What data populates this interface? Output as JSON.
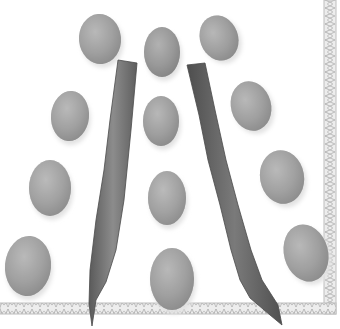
{
  "image": {
    "description": "Grayscale photograph of fourteen beans arranged around two long bean pods, with a decorative braided border along the right and bottom edges",
    "palette": {
      "background": "#ffffff",
      "bean_light": "#b4b4b4",
      "bean_mid": "#9a9a9a",
      "bean_dark": "#7c7c7c",
      "pod_light": "#8a8a8a",
      "pod_dark": "#555555",
      "border": "#c8c8c8",
      "border_line": "#a8a8a8"
    }
  },
  "beans": [
    {
      "cx": 100,
      "cy": 39,
      "rx": 21,
      "ry": 25,
      "rot": -5,
      "tone": "#a2a2a2"
    },
    {
      "cx": 162,
      "cy": 52,
      "rx": 18,
      "ry": 25,
      "rot": 0,
      "tone": "#8e8e8e"
    },
    {
      "cx": 219,
      "cy": 38,
      "rx": 19,
      "ry": 23,
      "rot": -20,
      "tone": "#a0a0a0"
    },
    {
      "cx": 70,
      "cy": 116,
      "rx": 19,
      "ry": 25,
      "rot": 5,
      "tone": "#a6a6a6"
    },
    {
      "cx": 161,
      "cy": 121,
      "rx": 18,
      "ry": 25,
      "rot": 0,
      "tone": "#a0a0a0"
    },
    {
      "cx": 251,
      "cy": 106,
      "rx": 20,
      "ry": 25,
      "rot": -15,
      "tone": "#a4a4a4"
    },
    {
      "cx": 50,
      "cy": 188,
      "rx": 21,
      "ry": 28,
      "rot": 0,
      "tone": "#a8a8a8"
    },
    {
      "cx": 167,
      "cy": 198,
      "rx": 19,
      "ry": 27,
      "rot": 0,
      "tone": "#a8a8a8"
    },
    {
      "cx": 282,
      "cy": 177,
      "rx": 22,
      "ry": 27,
      "rot": -10,
      "tone": "#a6a6a6"
    },
    {
      "cx": 28,
      "cy": 266,
      "rx": 23,
      "ry": 30,
      "rot": 5,
      "tone": "#a6a6a6"
    },
    {
      "cx": 172,
      "cy": 279,
      "rx": 22,
      "ry": 31,
      "rot": 0,
      "tone": "#a2a2a2"
    },
    {
      "cx": 306,
      "cy": 253,
      "rx": 22,
      "ry": 29,
      "rot": -15,
      "tone": "#a4a4a4"
    }
  ],
  "pods": [
    {
      "path": "M118,60 L137,63 L131,130 L124,200 L116,250 L106,282 L96,300 L92,326 L89,304 L90,270 L96,220 L104,170 L110,120 Z",
      "tone": "#7a7a7a"
    },
    {
      "path": "M187,65 L205,63 L215,110 L226,160 L238,205 L251,250 L262,280 L278,305 L282,325 L270,315 L250,298 L240,280 L231,250 L220,205 L208,160 L199,115 Z",
      "tone": "#666666"
    }
  ],
  "border": {
    "vertical": {
      "x": 324,
      "y": 0,
      "w": 12,
      "h": 314
    },
    "horizontal": {
      "x": 0,
      "y": 303,
      "w": 336,
      "h": 11
    }
  }
}
